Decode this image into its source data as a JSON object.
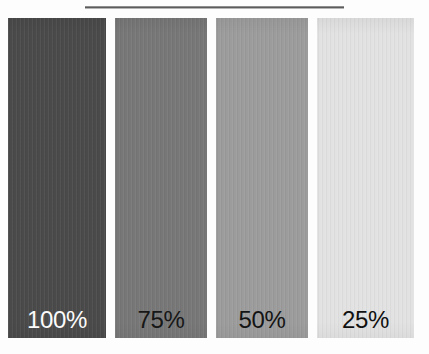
{
  "figure": {
    "background_color": "#fdfdfd",
    "width": 429,
    "height": 354
  },
  "top_rule": {
    "name": "horizontal-rule",
    "color": "#5c5c5c",
    "left": 85,
    "top": 6,
    "width": 259,
    "height": 3
  },
  "chart_data": {
    "type": "bar",
    "title": "",
    "subtitle": "",
    "xlabel": "",
    "ylabel": "",
    "orientation": "vertical",
    "grid": false,
    "legend": false,
    "axis_visible": false,
    "categories": [
      "100%",
      "75%",
      "50%",
      "25%"
    ],
    "values": [
      100,
      75,
      50,
      25
    ],
    "ylim": [
      0,
      100
    ],
    "value_unit": "%",
    "bars": [
      {
        "label": "100%",
        "value": 100,
        "fill": "#4a4a4a",
        "label_color": "#fbfbfb",
        "left": 0,
        "width": 98
      },
      {
        "label": "75%",
        "value": 75,
        "fill": "#777777",
        "label_color": "#171717",
        "left": 107,
        "width": 92
      },
      {
        "label": "50%",
        "value": 50,
        "fill": "#9c9c9c",
        "label_color": "#141414",
        "left": 208,
        "width": 92
      },
      {
        "label": "25%",
        "value": 25,
        "fill": "#e2e2e2",
        "label_color": "#111111",
        "left": 309,
        "width": 97
      }
    ]
  }
}
